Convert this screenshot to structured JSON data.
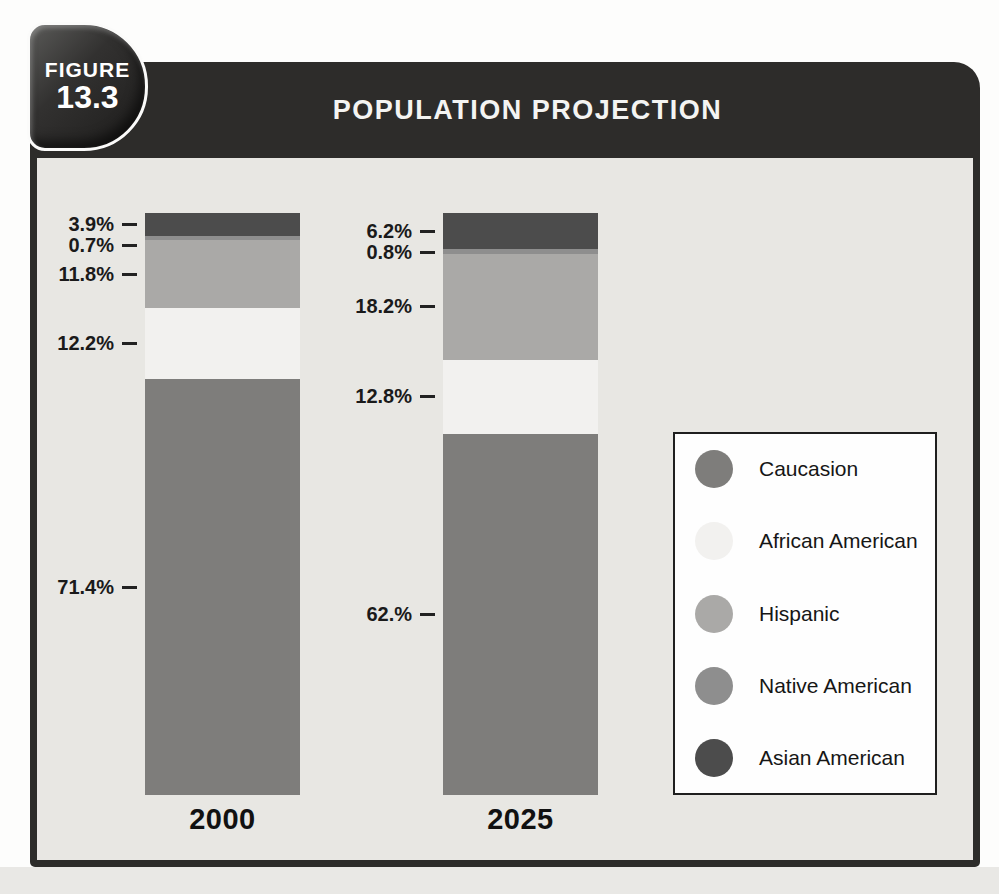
{
  "figure": {
    "badge_label": "FIGURE",
    "badge_number": "13.3",
    "title": "POPULATION PROJECTION"
  },
  "chart_data": {
    "type": "bar",
    "variant": "stacked-percent-column",
    "title": "POPULATION PROJECTION",
    "categories": [
      "2000",
      "2025"
    ],
    "series": [
      {
        "name": "Asian American",
        "color_key": "asian",
        "values": [
          3.9,
          6.2
        ]
      },
      {
        "name": "Native American",
        "color_key": "native",
        "values": [
          0.7,
          0.8
        ]
      },
      {
        "name": "Hispanic",
        "color_key": "hispanic",
        "values": [
          11.8,
          18.2
        ]
      },
      {
        "name": "African American",
        "color_key": "african",
        "values": [
          12.2,
          12.8
        ]
      },
      {
        "name": "Caucasion",
        "color_key": "caucasian",
        "values": [
          71.4,
          62.0
        ]
      }
    ],
    "value_labels": [
      [
        "3.9%",
        "0.7%",
        "11.8%",
        "12.2%",
        "71.4%"
      ],
      [
        "6.2%",
        "0.8%",
        "18.2%",
        "12.8%",
        "62.%"
      ]
    ],
    "colors": {
      "asian": "#4c4c4c",
      "native": "#8e8e8e",
      "hispanic": "#aaa9a7",
      "african": "#f2f1ef",
      "caucasian": "#7e7d7b"
    },
    "ylim": [
      0,
      100
    ],
    "grid": false,
    "legend_position": "right"
  },
  "legend": {
    "items": [
      {
        "label": "Caucasion",
        "color_key": "caucasian"
      },
      {
        "label": "African American",
        "color_key": "african"
      },
      {
        "label": "Hispanic",
        "color_key": "hispanic"
      },
      {
        "label": "Native American",
        "color_key": "native"
      },
      {
        "label": "Asian American",
        "color_key": "asian"
      }
    ]
  }
}
